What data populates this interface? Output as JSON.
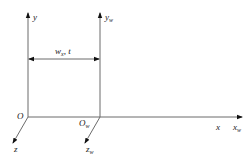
{
  "diagram": {
    "type": "coordinate-frames",
    "colors": {
      "axis": "#6b6b6b",
      "arrow": "#111111",
      "text": "#222222"
    },
    "frame_world": {
      "origin_label": "O",
      "x_label": "x",
      "y_label": "y",
      "z_label": "z"
    },
    "frame_w": {
      "origin_label": "O",
      "origin_sub": "w",
      "x_label": "x",
      "x_sub": "w",
      "y_label": "y",
      "y_sub": "w",
      "z_label": "z",
      "z_sub": "w"
    },
    "offset": {
      "label_main": "w",
      "label_sub": "x",
      "label_rest": ", t"
    }
  }
}
